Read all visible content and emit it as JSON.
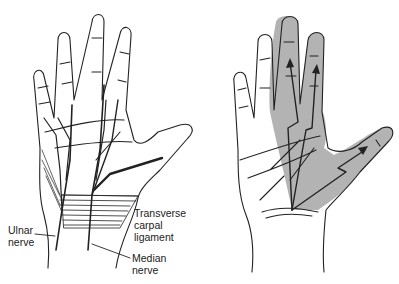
{
  "figure": {
    "left_panel": {
      "description": "Palmar view of hand showing nerves and carpal ligament",
      "labels": {
        "ulnar_nerve": [
          "Ulnar",
          "nerve"
        ],
        "transverse_carpal_ligament": [
          "Transverse",
          "carpal",
          "ligament"
        ],
        "median_nerve": [
          "Median",
          "nerve"
        ]
      }
    },
    "right_panel": {
      "description": "Median nerve sensory distribution with shaded area and lightning-bolt arrows",
      "shading_color": "#b3b3b3",
      "arrow_count": 3
    },
    "colors": {
      "line": "#222222",
      "shade": "#b3b3b3",
      "background": "#ffffff"
    }
  }
}
